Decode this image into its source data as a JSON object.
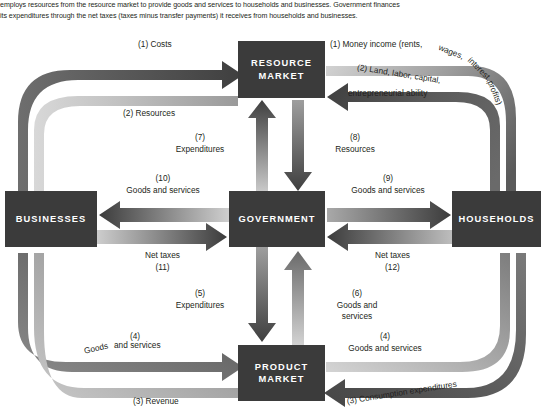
{
  "caption": {
    "lines": [
      "employs resources from the resource market to provide goods and services to households and businesses. Government finances",
      "its expenditures through the net taxes (taxes minus transfer payments) it receives from households and businesses."
    ]
  },
  "colors": {
    "box_fill": "#3b3b3b",
    "box_text": "#ffffff",
    "flow_dark": "#4a4a4a",
    "flow_light": "#c9c9c9",
    "page_text": "#231f20",
    "background": "#ffffff"
  },
  "boxes": {
    "resource_market": {
      "line1": "RESOURCE",
      "line2": "MARKET"
    },
    "businesses": {
      "line1": "BUSINESSES"
    },
    "government": {
      "line1": "GOVERNMENT"
    },
    "households": {
      "line1": "HOUSEHOLDS"
    },
    "product_market": {
      "line1": "PRODUCT",
      "line2": "MARKET"
    }
  },
  "flows": [
    {
      "id": "1-costs",
      "number": "(1)",
      "label": "Costs",
      "text": "(1) Costs",
      "from": "businesses",
      "to": "resource_market"
    },
    {
      "id": "1-money-income",
      "number": "(1)",
      "label": "Money income (rents, wages, interest, profits)",
      "text": "(1) Money income (rents, wages, interest, profits)",
      "from": "resource_market",
      "to": "households"
    },
    {
      "id": "2-resources",
      "number": "(2)",
      "label": "Resources",
      "text": "(2) Resources",
      "from": "resource_market",
      "to": "businesses"
    },
    {
      "id": "2-land-labor",
      "number": "(2)",
      "label": "Land, labor, capital, entrepreneurial ability",
      "text": "(2) Land, labor, capital, entrepreneurial ability",
      "from": "households",
      "to": "resource_market"
    },
    {
      "id": "3-revenue",
      "number": "(3)",
      "label": "Revenue",
      "text": "(3) Revenue",
      "from": "product_market",
      "to": "businesses"
    },
    {
      "id": "3-consumption",
      "number": "(3)",
      "label": "Consumption expenditures",
      "text": "(3) Consumption expenditures",
      "from": "households",
      "to": "product_market"
    },
    {
      "id": "4-goods-left",
      "number": "(4)",
      "label": "Goods and services",
      "text": "(4) Goods and services",
      "from": "businesses",
      "to": "product_market"
    },
    {
      "id": "4-goods-right",
      "number": "(4)",
      "label": "Goods and services",
      "text": "(4) Goods and services",
      "from": "product_market",
      "to": "households"
    },
    {
      "id": "5-expenditures",
      "number": "(5)",
      "label": "Expenditures",
      "text": "(5) Expenditures",
      "from": "government",
      "to": "product_market"
    },
    {
      "id": "6-goods-and-services",
      "number": "(6)",
      "label": "Goods and services",
      "text": "(6) Goods and services",
      "from": "product_market",
      "to": "government"
    },
    {
      "id": "7-expenditures",
      "number": "(7)",
      "label": "Expenditures",
      "text": "(7) Expenditures",
      "from": "government",
      "to": "resource_market"
    },
    {
      "id": "8-resources",
      "number": "(8)",
      "label": "Resources",
      "text": "(8) Resources",
      "from": "resource_market",
      "to": "government"
    },
    {
      "id": "9-goods-and-services",
      "number": "(9)",
      "label": "Goods and services",
      "text": "(9) Goods and services",
      "from": "government",
      "to": "households"
    },
    {
      "id": "10-goods-and-services",
      "number": "(10)",
      "label": "Goods and services",
      "text": "(10) Goods and services",
      "from": "government",
      "to": "businesses"
    },
    {
      "id": "11-net-taxes",
      "number": "(11)",
      "label": "Net taxes",
      "text": "Net taxes (11)",
      "from": "businesses",
      "to": "government"
    },
    {
      "id": "12-net-taxes",
      "number": "(12)",
      "label": "Net taxes",
      "text": "Net taxes (12)",
      "from": "households",
      "to": "government"
    }
  ],
  "labels": {
    "costs": "(1) Costs",
    "resources_left": "(2) Resources",
    "money_income": "(1) Money income (rents, wages, interest, profits)",
    "money_income_part1": "(1) Money income (rents,",
    "money_income_part2": "wages,",
    "money_income_part3": "interest,",
    "money_income_part4": "profits)",
    "land_labor_part1": "(2) Land, labor, capital,",
    "land_labor_part2": "entrepreneurial ability",
    "seven_num": "(7)",
    "seven_label": "Expenditures",
    "eight_num": "(8)",
    "eight_label": "Resources",
    "ten_num": "(10)",
    "ten_label": "Goods and services",
    "nine_num": "(9)",
    "nine_label": "Goods and services",
    "net_taxes_left": "Net taxes",
    "net_taxes_left_num": "(11)",
    "net_taxes_right": "Net taxes",
    "net_taxes_right_num": "(12)",
    "five_num": "(5)",
    "five_label": "Expenditures",
    "six_num": "(6)",
    "six_label_l1": "Goods and",
    "six_label_l2": "services",
    "four_left_num": "(4)",
    "four_left_l1": "Goods",
    "four_left_l2": "and services",
    "four_right_num": "(4)",
    "four_right_label": "Goods and services",
    "revenue": "(3) Revenue",
    "consumption": "(3) Consumption expenditures"
  }
}
